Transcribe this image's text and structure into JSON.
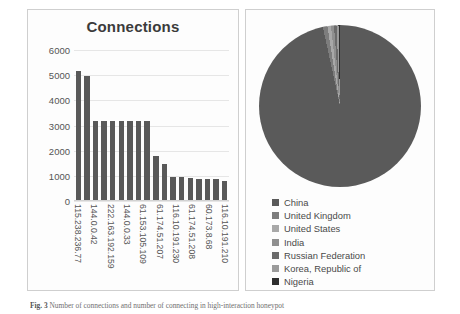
{
  "chart_data": [
    {
      "type": "bar",
      "title": "Connections",
      "xlabel": "",
      "ylabel": "",
      "ylim": [
        0,
        6000
      ],
      "yticks": [
        0,
        1000,
        2000,
        3000,
        4000,
        5000,
        6000
      ],
      "grid": true,
      "legend": "none",
      "bar_color": "#595959",
      "categories": [
        "115.238.236.77",
        "",
        "144.0.0.42",
        "",
        "222.163.192.159",
        "",
        "144.0.0.33",
        "",
        "61.153.105.109",
        "",
        "61.174.51.207",
        "",
        "116.10.191.230",
        "",
        "61.174.51.208",
        "",
        "60.173.8.68",
        "",
        "116.10.191.210"
      ],
      "tick_labels": [
        "115.238.236.77",
        "144.0.0.42",
        "222.163.192.159",
        "144.0.0.33",
        "61.153.105.109",
        "61.174.51.207",
        "116.10.191.230",
        "61.174.51.208",
        "60.173.8.68",
        "116.10.191.210"
      ],
      "values": [
        5150,
        4950,
        3180,
        3180,
        3180,
        3180,
        3180,
        3180,
        3180,
        1800,
        1480,
        960,
        950,
        900,
        890,
        880,
        870,
        790
      ]
    },
    {
      "type": "pie",
      "title": "",
      "legend_position": "bottom",
      "labels": [
        "China",
        "United Kingdom",
        "United States",
        "India",
        "Russian Federation",
        "Korea, Republic of",
        "Nigeria"
      ],
      "values": [
        96.6,
        0.9,
        0.7,
        0.6,
        0.5,
        0.4,
        0.3
      ],
      "colors": [
        "#5a5a5a",
        "#7d7d7d",
        "#a8a8a8",
        "#8f8f8f",
        "#6b6b6b",
        "#9b9b9b",
        "#2e2e2e"
      ]
    }
  ],
  "bar_panel": {
    "title": "Connections",
    "y_ticks": [
      "6000",
      "5000",
      "4000",
      "3000",
      "2000",
      "1000",
      "0"
    ]
  },
  "pie_panel": {
    "legend": [
      {
        "label": "China",
        "color": "#5a5a5a"
      },
      {
        "label": "United Kingdom",
        "color": "#7d7d7d"
      },
      {
        "label": "United States",
        "color": "#a8a8a8"
      },
      {
        "label": "India",
        "color": "#8f8f8f"
      },
      {
        "label": "Russian Federation",
        "color": "#6b6b6b"
      },
      {
        "label": "Korea, Republic of",
        "color": "#9b9b9b"
      },
      {
        "label": "Nigeria",
        "color": "#2e2e2e"
      }
    ]
  },
  "caption": {
    "figure_number": "Fig. 3",
    "text": "Number of connections and number of connecting in high-interaction honeypot"
  }
}
